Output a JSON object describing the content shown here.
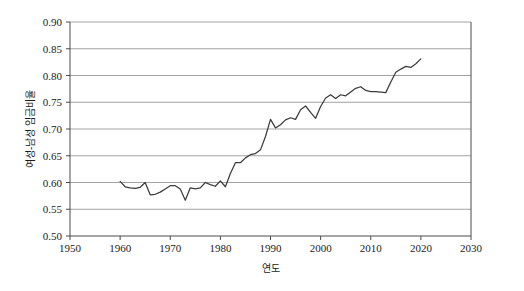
{
  "chart_data": {
    "type": "line",
    "title": "",
    "xlabel": "연도",
    "ylabel": "여성-남성 임금비율",
    "xlim": [
      1950,
      2030
    ],
    "ylim": [
      0.5,
      0.9
    ],
    "grid": true,
    "legend": "none",
    "x_ticks": [
      1950,
      1960,
      1970,
      1980,
      1990,
      2000,
      2010,
      2020,
      2030
    ],
    "x_tick_labels": [
      "1950",
      "1960",
      "1970",
      "1980",
      "1990",
      "2000",
      "2010",
      "2020",
      "2030"
    ],
    "y_ticks": [
      0.5,
      0.55,
      0.6,
      0.65,
      0.7,
      0.75,
      0.8,
      0.85,
      0.9
    ],
    "y_tick_labels": [
      "0.50",
      "0.55",
      "0.60",
      "0.65",
      "0.70",
      "0.75",
      "0.80",
      "0.85",
      "0.90"
    ],
    "series": [
      {
        "name": "여성-남성 임금비율",
        "color": "#3c3c3c",
        "x": [
          1960,
          1961,
          1962,
          1963,
          1964,
          1965,
          1966,
          1967,
          1968,
          1969,
          1970,
          1971,
          1972,
          1973,
          1974,
          1975,
          1976,
          1977,
          1978,
          1979,
          1980,
          1981,
          1982,
          1983,
          1984,
          1985,
          1986,
          1987,
          1988,
          1989,
          1990,
          1991,
          1992,
          1993,
          1994,
          1995,
          1996,
          1997,
          1998,
          1999,
          2000,
          2001,
          2002,
          2003,
          2004,
          2005,
          2006,
          2007,
          2008,
          2009,
          2010,
          2011,
          2012,
          2013,
          2014,
          2015,
          2016,
          2017,
          2018,
          2019,
          2020
        ],
        "values": [
          0.602,
          0.592,
          0.59,
          0.589,
          0.591,
          0.6,
          0.577,
          0.578,
          0.582,
          0.588,
          0.594,
          0.594,
          0.588,
          0.567,
          0.59,
          0.588,
          0.59,
          0.6,
          0.596,
          0.593,
          0.603,
          0.592,
          0.617,
          0.637,
          0.637,
          0.646,
          0.652,
          0.654,
          0.661,
          0.686,
          0.718,
          0.702,
          0.708,
          0.717,
          0.721,
          0.718,
          0.736,
          0.743,
          0.731,
          0.72,
          0.742,
          0.758,
          0.764,
          0.757,
          0.764,
          0.762,
          0.769,
          0.776,
          0.779,
          0.772,
          0.77,
          0.77,
          0.769,
          0.768,
          0.788,
          0.806,
          0.812,
          0.817,
          0.815,
          0.822,
          0.831
        ]
      }
    ]
  },
  "axes": {
    "x_axis_title": "연도",
    "y_axis_title": "여성-남성 임금비율"
  }
}
